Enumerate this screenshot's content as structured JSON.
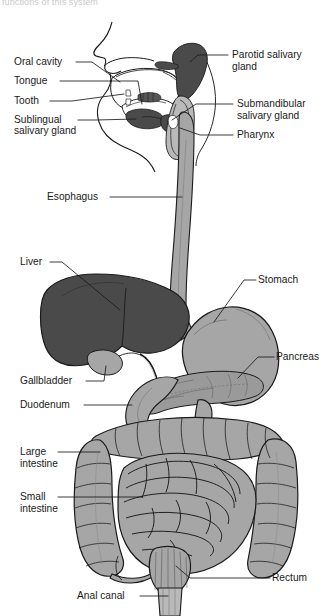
{
  "figure": {
    "title_fragment": "functions of this system",
    "view": "sagittal / anterior schematic",
    "background_color": "#ffffff",
    "line_color": "#1a1a1a",
    "label_font_size_px": 10.2
  },
  "palette": {
    "dark_organ": "#4a4a4a",
    "darker_organ": "#3c3c3c",
    "mid_organ": "#a6a6a6",
    "light_organ": "#b9b9b9",
    "pancreas": "#9a9a9a",
    "outline": "#1a1a1a",
    "white": "#ffffff"
  },
  "labels": {
    "left": [
      {
        "id": "oral-cavity",
        "text": "Oral cavity",
        "x": 14,
        "y": 65
      },
      {
        "id": "tongue",
        "text": "Tongue",
        "x": 14,
        "y": 84
      },
      {
        "id": "tooth",
        "text": "Tooth",
        "x": 14,
        "y": 104
      },
      {
        "id": "sublingual-1",
        "text": "Sublingual",
        "x": 14,
        "y": 123
      },
      {
        "id": "sublingual-2",
        "text": "salivary gland",
        "x": 14,
        "y": 134
      },
      {
        "id": "esophagus",
        "text": "Esophagus",
        "x": 47,
        "y": 200
      },
      {
        "id": "liver",
        "text": "Liver",
        "x": 20,
        "y": 265
      },
      {
        "id": "gallbladder",
        "text": "Gallbladder",
        "x": 20,
        "y": 384
      },
      {
        "id": "duodenum",
        "text": "Duodenum",
        "x": 20,
        "y": 408
      },
      {
        "id": "large-int-1",
        "text": "Large",
        "x": 20,
        "y": 455
      },
      {
        "id": "large-int-2",
        "text": "intestine",
        "x": 20,
        "y": 467
      },
      {
        "id": "small-int-1",
        "text": "Small",
        "x": 20,
        "y": 500
      },
      {
        "id": "small-int-2",
        "text": "intestine",
        "x": 20,
        "y": 512
      },
      {
        "id": "anal-canal",
        "text": "Anal canal",
        "x": 77,
        "y": 599
      }
    ],
    "right": [
      {
        "id": "parotid-1",
        "text": "Parotid salivary",
        "x": 232,
        "y": 58
      },
      {
        "id": "parotid-2",
        "text": "gland",
        "x": 232,
        "y": 70
      },
      {
        "id": "submandibular-1",
        "text": "Submandibular",
        "x": 237,
        "y": 107
      },
      {
        "id": "submandibular-2",
        "text": "salivary gland",
        "x": 237,
        "y": 119
      },
      {
        "id": "pharynx",
        "text": "Pharynx",
        "x": 237,
        "y": 138
      },
      {
        "id": "stomach",
        "text": "Stomach",
        "x": 258,
        "y": 283
      },
      {
        "id": "pancreas",
        "text": "Pancreas",
        "x": 276,
        "y": 360
      },
      {
        "id": "rectum",
        "text": "Rectum",
        "x": 272,
        "y": 581
      }
    ]
  },
  "organs": [
    {
      "id": "oral-cavity",
      "name": "Oral cavity",
      "shade": "white"
    },
    {
      "id": "tongue",
      "name": "Tongue",
      "shade": "white"
    },
    {
      "id": "tooth",
      "name": "Tooth",
      "shade": "white"
    },
    {
      "id": "sublingual-salivary-gland",
      "name": "Sublingual salivary gland",
      "shade": "dark"
    },
    {
      "id": "parotid-salivary-gland",
      "name": "Parotid salivary gland",
      "shade": "dark"
    },
    {
      "id": "submandibular-salivary-gland",
      "name": "Submandibular salivary gland",
      "shade": "dark"
    },
    {
      "id": "pharynx",
      "name": "Pharynx",
      "shade": "mid"
    },
    {
      "id": "esophagus",
      "name": "Esophagus",
      "shade": "mid"
    },
    {
      "id": "liver",
      "name": "Liver",
      "shade": "dark"
    },
    {
      "id": "gallbladder",
      "name": "Gallbladder",
      "shade": "mid"
    },
    {
      "id": "stomach",
      "name": "Stomach",
      "shade": "mid"
    },
    {
      "id": "pancreas",
      "name": "Pancreas",
      "shade": "pancreas"
    },
    {
      "id": "duodenum",
      "name": "Duodenum",
      "shade": "mid"
    },
    {
      "id": "small-intestine",
      "name": "Small intestine",
      "shade": "mid"
    },
    {
      "id": "large-intestine",
      "name": "Large intestine",
      "shade": "mid"
    },
    {
      "id": "rectum",
      "name": "Rectum",
      "shade": "mid"
    },
    {
      "id": "anal-canal",
      "name": "Anal canal",
      "shade": "light"
    }
  ]
}
